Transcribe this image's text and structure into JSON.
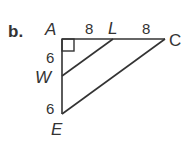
{
  "problem": {
    "label": "b."
  },
  "figure": {
    "type": "right-triangle-with-midsegment",
    "right_angle_at": "A",
    "vertices": {
      "A": "A",
      "L": "L",
      "C": "C",
      "W": "W",
      "E": "E"
    },
    "segments": {
      "AL": "8",
      "LC": "8",
      "AW": "6",
      "WE": "6"
    },
    "colors": {
      "stroke": "#333333",
      "background": "#ffffff"
    }
  }
}
